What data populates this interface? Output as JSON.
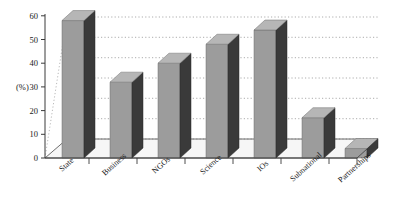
{
  "chart_data": {
    "type": "bar",
    "title": "",
    "subtitle": "",
    "xlabel": "",
    "ylabel": "(%)",
    "categories": [
      "State",
      "Business",
      "NGOs",
      "Science",
      "IOs",
      "Subnational",
      "Partnerships"
    ],
    "values": [
      58,
      32,
      40,
      48,
      54,
      17,
      4
    ],
    "ylim": [
      0,
      60
    ],
    "yticks": [
      0,
      10,
      20,
      30,
      40,
      50,
      60
    ],
    "ytick_labels": [
      "0",
      "10",
      "20",
      "30",
      "40",
      "50",
      "60"
    ],
    "grid": true,
    "grid_style": "dotted-horizontal",
    "legend": "none",
    "style": "3d-bars",
    "series": [
      {
        "name": "Share",
        "values": [
          58,
          32,
          40,
          48,
          54,
          17,
          4
        ]
      }
    ],
    "colors": {
      "bar_front": "#9c9c9c",
      "bar_side": "#3a3a3a",
      "bar_top": "#b4b4b4",
      "axis": "#3a3a3a",
      "grid": "#9a9a9a",
      "floor": "#f2f2f2",
      "text": "#1a1a1a"
    }
  }
}
